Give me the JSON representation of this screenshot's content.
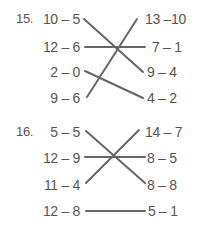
{
  "problems": [
    {
      "number": "15.",
      "left": [
        "10 – 5",
        "12 – 6",
        "2 – 0",
        "9 – 6"
      ],
      "right": [
        "13 –10",
        "7 – 1",
        "9 – 4",
        "4 – 2"
      ],
      "matches": [
        {
          "left": "10 – 5",
          "right": "9 – 4"
        },
        {
          "left": "12 – 6",
          "right": "7 – 1"
        },
        {
          "left": "2 – 0",
          "right": "4 – 2"
        },
        {
          "left": "9 – 6",
          "right": "13 –10"
        }
      ]
    },
    {
      "number": "16.",
      "left": [
        "5 – 5",
        "12 – 9",
        "11 – 4",
        "12 – 8"
      ],
      "right": [
        "14 – 7",
        "8 – 5",
        "8 – 8",
        "5 – 1"
      ],
      "matches": [
        {
          "left": "5 – 5",
          "right": "8 – 8"
        },
        {
          "left": "12 – 9",
          "right": "8 – 5"
        },
        {
          "left": "11 – 4",
          "right": "14 – 7"
        },
        {
          "left": "12 – 8",
          "right": "5 – 1"
        }
      ]
    }
  ],
  "line_color": "#666666"
}
